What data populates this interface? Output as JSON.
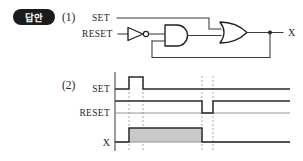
{
  "badge": {
    "label": "답안"
  },
  "sections": [
    {
      "number": "(1)",
      "kind": "logic-circuit"
    },
    {
      "number": "(2)",
      "kind": "timing-diagram"
    }
  ],
  "circuit": {
    "inputs": [
      {
        "name": "SET",
        "label": "SET"
      },
      {
        "name": "RESET",
        "label": "RESET"
      }
    ],
    "output": {
      "name": "X",
      "label": "X"
    },
    "gates": [
      {
        "type": "NOT",
        "name": "not-gate",
        "input": "RESET"
      },
      {
        "type": "AND",
        "name": "and-gate",
        "inputs": [
          "NOT-out",
          "X-feedback"
        ]
      },
      {
        "type": "OR",
        "name": "or-gate",
        "inputs": [
          "SET",
          "AND-out"
        ],
        "output": "X"
      }
    ],
    "feedback": {
      "from": "X",
      "to": "and-gate",
      "name": "feedback-wire"
    }
  },
  "timing": {
    "signals": [
      {
        "name": "SET",
        "label": "SET",
        "idle": "low",
        "description": "low, short high pulse, then low"
      },
      {
        "name": "RESET",
        "label": "RESET",
        "idle": "high",
        "description": "high, short low pulse near the end, then high"
      },
      {
        "name": "X",
        "label": "X",
        "idle": "low",
        "filled": true,
        "description": "low, goes high at SET pulse, stays high until RESET pulse, then low"
      }
    ],
    "guides": 3
  },
  "colors": {
    "badge_bg": "#1b1b1b",
    "badge_text": "#ffffff",
    "wire": "#3a3a3a",
    "gate_stroke": "#1f1f1f",
    "wave": "#2b2b2b",
    "x_fill": "#c9c9c9",
    "guide": "#9a9a9a",
    "background": "#ffffff"
  }
}
